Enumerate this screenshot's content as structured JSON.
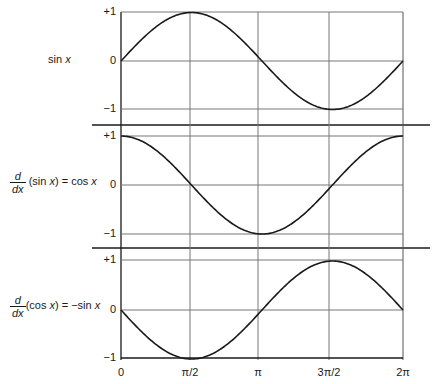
{
  "panels": [
    {
      "label": {
        "text": "sin x",
        "prefix": "sin ",
        "var": "x"
      },
      "yticks": [
        "+1",
        "0",
        "−1"
      ],
      "curve": "sin"
    },
    {
      "label": {
        "frac_num": "d",
        "frac_den": "dx",
        "body_a": " (sin ",
        "var_a": "x",
        "body_b": ") = cos ",
        "var_b": "x"
      },
      "yticks": [
        "+1",
        "0",
        "−1"
      ],
      "curve": "cos"
    },
    {
      "label": {
        "frac_num": "d",
        "frac_den": "dx",
        "body_a": "(cos ",
        "var_a": "x",
        "body_b": ") = −sin ",
        "var_b": "x"
      },
      "yticks": [
        "+1",
        "0",
        "−1"
      ],
      "curve": "-sin"
    }
  ],
  "xticks": [
    "0",
    "π/2",
    "π",
    "3π/2",
    "2π"
  ],
  "chart_data": {
    "type": "line",
    "title": "",
    "x": [
      "0",
      "π/2",
      "π",
      "3π/2",
      "2π"
    ],
    "series": [
      {
        "name": "sin x",
        "values": [
          0,
          1,
          0,
          -1,
          0
        ]
      },
      {
        "name": "d/dx (sin x) = cos x",
        "values": [
          1,
          0,
          -1,
          0,
          1
        ]
      },
      {
        "name": "d/dx (cos x) = −sin x",
        "values": [
          0,
          -1,
          0,
          1,
          0
        ]
      }
    ],
    "ylim": [
      -1,
      1
    ],
    "xlim": [
      "0",
      "2π"
    ],
    "grid": true
  }
}
